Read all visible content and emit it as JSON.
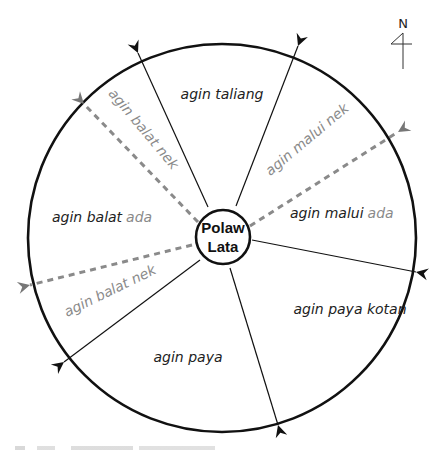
{
  "diagram": {
    "center_label_line1": "Polaw",
    "center_label_line2": "Lata",
    "north_label": "N",
    "sectors": [
      {
        "id": "taliang",
        "label": "agin taliang"
      },
      {
        "id": "malui",
        "label_main": "agin malui",
        "label_suffix": "ada"
      },
      {
        "id": "paya-kotan",
        "label": "agin paya kotan"
      },
      {
        "id": "paya",
        "label": "agin paya"
      },
      {
        "id": "balat",
        "label_main": "agin balat",
        "label_suffix": "ada"
      }
    ],
    "sub_directions": [
      {
        "id": "balat-nek-upper",
        "label": "agin balat nek"
      },
      {
        "id": "malui-nek",
        "label": "agin malui nek"
      },
      {
        "id": "balat-nek-lower",
        "label": "agin balat nek"
      }
    ],
    "colors": {
      "primary_line": "#111111",
      "secondary_dashed": "#8a8a8a",
      "label_text": "#222222",
      "secondary_text": "#8a8a8a"
    }
  }
}
